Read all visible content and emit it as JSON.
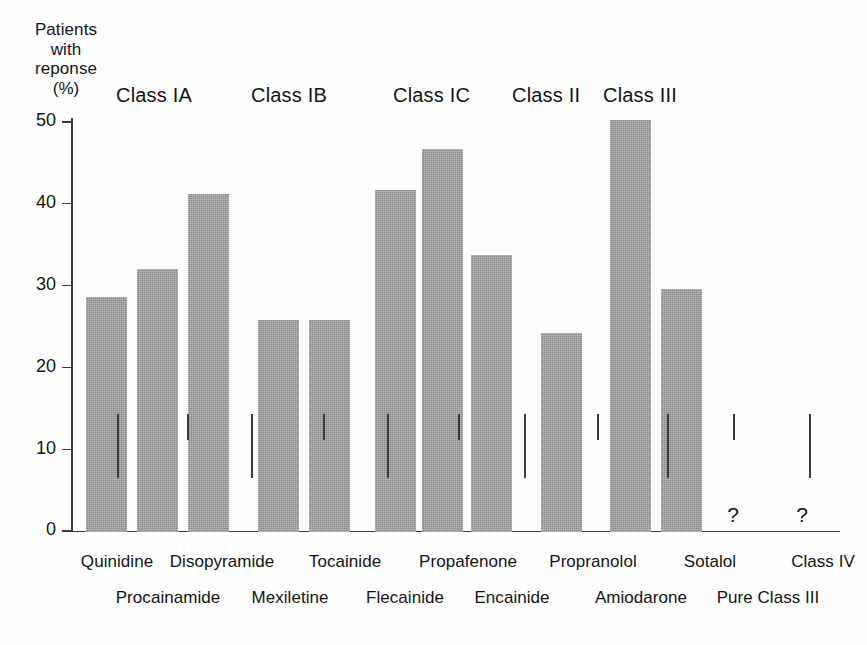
{
  "figure": {
    "background_color": "#ffffff",
    "axis_color": "#3a3a3a",
    "bar_color": "#9b9b9b",
    "text_color": "#141414"
  },
  "y_axis_title_lines": [
    "Patients",
    "with",
    "reponse",
    "(%)"
  ],
  "class_headers": [
    {
      "label": "Class IA",
      "x": 116
    },
    {
      "label": "Class IB",
      "x": 251
    },
    {
      "label": "Class IC",
      "x": 393
    },
    {
      "label": "Class II",
      "x": 512
    },
    {
      "label": "Class III",
      "x": 603
    }
  ],
  "y_ticks": [
    {
      "label": "50",
      "value": 50
    },
    {
      "label": "40",
      "value": 40
    },
    {
      "label": "30",
      "value": 30
    },
    {
      "label": "20",
      "value": 20
    },
    {
      "label": "10",
      "value": 10
    },
    {
      "label": "0",
      "value": 0
    }
  ],
  "x_tick_positions_upper": [
    46,
    116,
    180,
    252,
    316,
    387,
    453,
    526,
    596,
    662,
    738
  ],
  "x_tick_positions_lower": [
    46,
    116,
    180,
    252,
    316,
    387,
    453,
    526,
    596,
    662,
    738
  ],
  "x_labels_row1": [
    {
      "label": "Quinidine",
      "x": 117
    },
    {
      "label": "Disopyramide",
      "x": 222
    },
    {
      "label": "Tocainide",
      "x": 345
    },
    {
      "label": "Propafenone",
      "x": 468
    },
    {
      "label": "Propranolol",
      "x": 593
    },
    {
      "label": "Sotalol",
      "x": 710
    },
    {
      "label": "Class IV",
      "x": 823
    }
  ],
  "x_labels_row2": [
    {
      "label": "Procainamide",
      "x": 168
    },
    {
      "label": "Mexiletine",
      "x": 290
    },
    {
      "label": "Flecainide",
      "x": 405
    },
    {
      "label": "Encainide",
      "x": 512
    },
    {
      "label": "Amiodarone",
      "x": 641
    },
    {
      "label": "Pure Class III",
      "x": 768
    }
  ],
  "question_marks": [
    {
      "label": "?",
      "x": 733
    },
    {
      "label": "?",
      "x": 802
    }
  ],
  "chart_data": {
    "type": "bar",
    "title": "",
    "xlabel": "",
    "ylabel": "Patients with reponse (%)",
    "ylim": [
      0,
      51
    ],
    "yticks": [
      0,
      10,
      20,
      30,
      40,
      50
    ],
    "grid": false,
    "legend": "none",
    "categories": [
      "Quinidine",
      "Procainamide",
      "Disopyramide",
      "Mexiletine",
      "Tocainide",
      "Flecainide",
      "Propafenone",
      "Encainide",
      "Propranolol",
      "Amiodarone",
      "Sotalol",
      "Pure Class III",
      "Class IV"
    ],
    "values": [
      28.8,
      32.2,
      41.3,
      26.0,
      26.0,
      41.8,
      46.8,
      33.9,
      24.3,
      50.4,
      29.7,
      null,
      null
    ],
    "no_data_marker": "?",
    "groups": [
      {
        "name": "Class IA",
        "members": [
          "Quinidine",
          "Procainamide",
          "Disopyramide"
        ]
      },
      {
        "name": "Class IB",
        "members": [
          "Mexiletine",
          "Tocainide"
        ]
      },
      {
        "name": "Class IC",
        "members": [
          "Flecainide",
          "Propafenone",
          "Encainide"
        ]
      },
      {
        "name": "Class II",
        "members": [
          "Propranolol"
        ]
      },
      {
        "name": "Class III",
        "members": [
          "Amiodarone",
          "Sotalol"
        ]
      },
      {
        "name": "Unknown",
        "members": [
          "Pure Class III",
          "Class IV"
        ]
      }
    ]
  },
  "bars": [
    {
      "name": "Quinidine",
      "value": 28.8,
      "x": 15,
      "width": 41
    },
    {
      "name": "Procainamide",
      "value": 32.2,
      "x": 66,
      "width": 41
    },
    {
      "name": "Disopyramide",
      "value": 41.3,
      "x": 117,
      "width": 41
    },
    {
      "name": "Mexiletine",
      "value": 26.0,
      "x": 187,
      "width": 41
    },
    {
      "name": "Tocainide",
      "value": 26.0,
      "x": 238,
      "width": 41
    },
    {
      "name": "Flecainide",
      "value": 41.8,
      "x": 304,
      "width": 41
    },
    {
      "name": "Propafenone",
      "value": 46.8,
      "x": 351,
      "width": 41
    },
    {
      "name": "Encainide",
      "value": 33.9,
      "x": 400,
      "width": 41
    },
    {
      "name": "Propranolol",
      "value": 24.3,
      "x": 470,
      "width": 41
    },
    {
      "name": "Amiodarone",
      "value": 50.4,
      "x": 539,
      "width": 41
    },
    {
      "name": "Sotalol",
      "value": 29.7,
      "x": 590,
      "width": 41
    }
  ]
}
